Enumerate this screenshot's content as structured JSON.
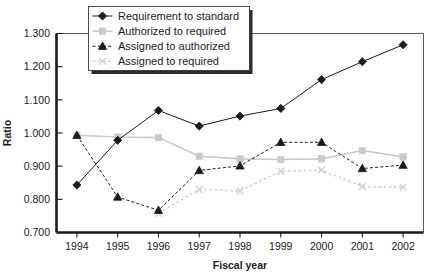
{
  "chart_data": {
    "type": "line",
    "title": "",
    "xlabel": "Fiscal year",
    "ylabel": "Ratio",
    "categories": [
      "1994",
      "1995",
      "1996",
      "1997",
      "1998",
      "1999",
      "2000",
      "2001",
      "2002"
    ],
    "ylim": [
      0.7,
      1.3
    ],
    "ytick_labels": [
      "1.300",
      "1.200",
      "1.100",
      "1.000",
      "0.900",
      "0.800",
      "0.700"
    ],
    "ytick_values": [
      1.3,
      1.2,
      1.1,
      1.0,
      0.9,
      0.8,
      0.7
    ],
    "grid": false,
    "legend_position": "top-left",
    "series": [
      {
        "name": "Requirement to standard",
        "marker": "diamond",
        "line_style": "solid",
        "color": "#1a1a1a",
        "values": [
          0.843,
          0.978,
          1.068,
          1.021,
          1.051,
          1.074,
          1.161,
          1.215,
          1.266
        ]
      },
      {
        "name": "Authorized to required",
        "marker": "square",
        "line_style": "solid",
        "color": "#c9c9c9",
        "values": [
          0.993,
          0.988,
          0.986,
          0.93,
          0.922,
          0.92,
          0.922,
          0.947,
          0.928
        ]
      },
      {
        "name": "Assigned to authorized",
        "marker": "triangle",
        "line_style": "dashed",
        "color": "#1a1a1a",
        "values": [
          0.993,
          0.807,
          0.767,
          0.887,
          0.901,
          0.972,
          0.972,
          0.893,
          0.903
        ]
      },
      {
        "name": "Assigned to required",
        "marker": "cross",
        "line_style": "dashed",
        "color": "#d4d4d4",
        "values": [
          null,
          null,
          0.758,
          0.83,
          0.825,
          0.885,
          0.888,
          0.839,
          0.836
        ]
      }
    ]
  },
  "legend": {
    "items": [
      {
        "label": "Requirement to standard",
        "marker": "diamond-marker"
      },
      {
        "label": "Authorized to required",
        "marker": "square-marker"
      },
      {
        "label": "Assigned to authorized",
        "marker": "triangle-marker"
      },
      {
        "label": "Assigned to required",
        "marker": "cross-marker"
      }
    ]
  },
  "axes": {
    "y_title": "Ratio",
    "x_title": "Fiscal year",
    "y_ticks": [
      "1.300",
      "1.200",
      "1.100",
      "1.000",
      "0.900",
      "0.800",
      "0.700"
    ],
    "x_ticks": [
      "1994",
      "1995",
      "1996",
      "1997",
      "1998",
      "1999",
      "2000",
      "2001",
      "2002"
    ]
  },
  "colors": {
    "dark": "#1a1a1a",
    "light_gray": "#c9c9c9",
    "lighter_gray": "#d4d4d4",
    "axis": "#1a1a1a",
    "plot_border": "#4a4a4a"
  }
}
